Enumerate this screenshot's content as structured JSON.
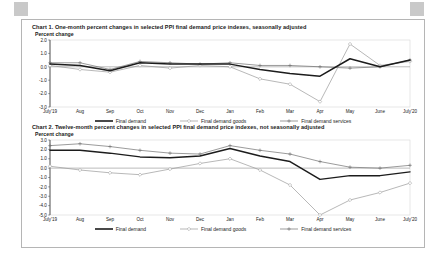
{
  "document": {
    "background_color": "#ffffff",
    "frame_border_color": "#b5b5b5",
    "corner_marker_color": "#c9c9c9"
  },
  "series_styles": {
    "final_demand": {
      "color": "#1c1c1c",
      "width": 1.5,
      "dash": "none",
      "marker": "none"
    },
    "final_demand_goods": {
      "color": "#9a9a9a",
      "width": 0.7,
      "dash": "none",
      "marker": "diamond"
    },
    "final_demand_services": {
      "color": "#707070",
      "width": 0.7,
      "dash": "none",
      "marker": "plus"
    }
  },
  "legend": {
    "items": [
      {
        "label": "Final demand",
        "key": "final_demand"
      },
      {
        "label": "Final demand goods",
        "key": "final_demand_goods"
      },
      {
        "label": "Final demand services",
        "key": "final_demand_services"
      }
    ]
  },
  "chart1": {
    "title": "Chart 1. One-month percent changes in selected PPI final demand price indexes, seasonally adjusted",
    "axis_label": "Percent change"
  },
  "chart2": {
    "title": "Chart 2. Twelve-month percent changes in selected PPI final demand price indexes, not seasonally adjusted",
    "axis_label": "Percent change"
  },
  "chart_data": [
    {
      "id": "chart1",
      "type": "line",
      "title": "Chart 1. One-month percent changes in selected PPI final demand price indexes, seasonally adjusted",
      "xlabel": "",
      "ylabel": "Percent change",
      "ylim": [
        -3.0,
        2.0
      ],
      "yticks": [
        2.0,
        1.0,
        0.0,
        -1.0,
        -2.0,
        -3.0
      ],
      "ytick_labels": [
        "2.0",
        "1.0",
        "0.0",
        "-1.0",
        "-2.0",
        "-3.0"
      ],
      "grid": false,
      "legend_position": "bottom",
      "categories": [
        "July'19",
        "Aug",
        "Sep",
        "Oct",
        "Nov",
        "Dec",
        "Jan",
        "Feb",
        "Mar",
        "Apr",
        "May",
        "June",
        "July'20"
      ],
      "series": [
        {
          "name": "Final demand",
          "values": [
            0.2,
            0.1,
            -0.1,
            -0.3,
            0.2,
            0.0,
            -0.2,
            0.2,
            0.3,
            0.3,
            -0.2,
            -1.3,
            -0.4,
            0.4,
            0.2,
            0.6
          ]
        },
        {
          "name": "Final demand goods",
          "values": [
            0.1,
            -0.2,
            -0.3,
            0.4,
            -0.4,
            0.2,
            -0.4,
            -0.9,
            -1.2,
            -2.6,
            1.7,
            0.2,
            0.6
          ]
        },
        {
          "name": "Final demand services",
          "values": [
            0.3,
            0.3,
            -0.2,
            0.5,
            0.3,
            0.2,
            0.3,
            0.1,
            0.1,
            0.0,
            -0.2,
            0.0,
            0.4
          ]
        }
      ],
      "series_corrected": {
        "Final demand": [
          0.2,
          0.1,
          -0.3,
          0.3,
          0.2,
          0.2,
          0.2,
          -0.2,
          -0.5,
          -0.7,
          0.6,
          0.0,
          0.5
        ],
        "Final demand goods": [
          0.1,
          -0.2,
          -0.4,
          0.1,
          -0.1,
          0.1,
          0.0,
          -0.9,
          -1.3,
          -2.6,
          1.7,
          0.1,
          0.4
        ],
        "Final demand services": [
          0.3,
          0.3,
          -0.2,
          0.4,
          0.3,
          0.2,
          0.3,
          0.1,
          0.1,
          0.0,
          -0.1,
          0.0,
          0.5
        ]
      }
    },
    {
      "id": "chart2",
      "type": "line",
      "title": "Chart 2. Twelve-month percent changes in selected PPI final demand price indexes, not seasonally adjusted",
      "xlabel": "",
      "ylabel": "Percent change",
      "ylim": [
        -5.0,
        3.0
      ],
      "yticks": [
        3.0,
        2.0,
        1.0,
        0.0,
        -1.0,
        -2.0,
        -3.0,
        -4.0,
        -5.0
      ],
      "ytick_labels": [
        "3.0",
        "2.0",
        "1.0",
        "0.0",
        "-1.0",
        "-2.0",
        "-3.0",
        "-4.0",
        "-5.0"
      ],
      "grid": false,
      "legend_position": "bottom",
      "categories": [
        "July'19",
        "Aug",
        "Sep",
        "Oct",
        "Nov",
        "Dec",
        "Jan",
        "Feb",
        "Mar",
        "Apr",
        "May",
        "June",
        "July'20"
      ],
      "series": [
        {
          "name": "Final demand",
          "values": [
            1.9,
            1.9,
            1.6,
            1.2,
            1.1,
            1.3,
            2.1,
            1.3,
            0.7,
            -1.2,
            -0.8,
            -0.8,
            -0.4
          ]
        },
        {
          "name": "Final demand goods",
          "values": [
            0.2,
            -0.2,
            -0.5,
            -0.7,
            -0.1,
            0.5,
            1.0,
            -0.2,
            -1.8,
            -5.0,
            -3.4,
            -2.6,
            -1.6
          ]
        },
        {
          "name": "Final demand services",
          "values": [
            2.4,
            2.6,
            2.3,
            1.9,
            1.6,
            1.5,
            2.4,
            1.9,
            1.5,
            0.7,
            0.1,
            0.0,
            0.3
          ]
        }
      ]
    }
  ]
}
